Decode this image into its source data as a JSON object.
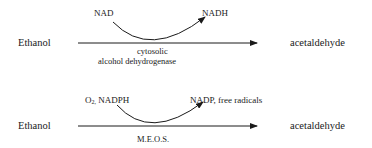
{
  "reactions": [
    {
      "substrate": "Ethanol",
      "product": "acetaldehyde",
      "cofactor_in": "NAD",
      "cofactor_out": "NADH",
      "enzyme_line1": "cytosolic",
      "enzyme_line2": "alcohol dehydrogenase"
    },
    {
      "substrate": "Ethanol",
      "product": "acetaldehyde",
      "cofactor_in_prefix": "O",
      "cofactor_in_sub": "2,",
      "cofactor_in_rest": " NADPH",
      "cofactor_out": "NADP, free radicals",
      "enzyme_line1": "M.E.O.S."
    }
  ]
}
